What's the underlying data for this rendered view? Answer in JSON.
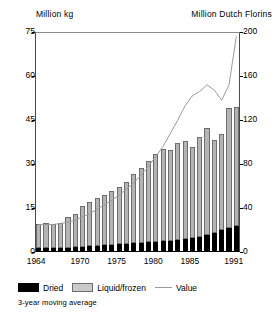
{
  "header": {
    "left_axis_title": "Million kg",
    "right_axis_title": "Million Dutch Florins"
  },
  "legend": {
    "dried_label": "Dried",
    "liquid_label": "Liquid/frozen",
    "value_label": "Value",
    "footnote": "3-year moving average"
  },
  "colors": {
    "dried": "#000000",
    "liquid": "#b4b4b4",
    "value_line": "#9a9a9a",
    "axis": "#000000"
  },
  "chart_data": {
    "type": "bar",
    "title": "",
    "subtitle": "",
    "xlabel": "",
    "ylabel": "Million kg",
    "y2label": "Million Dutch Florins",
    "ylim": [
      0,
      75
    ],
    "y2lim": [
      0,
      200
    ],
    "yticks": [
      0,
      15,
      30,
      45,
      60,
      75
    ],
    "y2ticks": [
      0,
      40,
      80,
      120,
      160,
      200
    ],
    "grid": false,
    "legend_position": "below",
    "categories": [
      "1964",
      "1965",
      "1966",
      "1967",
      "1968",
      "1969",
      "1970",
      "1971",
      "1972",
      "1973",
      "1974",
      "1975",
      "1976",
      "1977",
      "1978",
      "1979",
      "1980",
      "1981",
      "1982",
      "1983",
      "1984",
      "1985",
      "1986",
      "1987",
      "1988",
      "1989",
      "1990",
      "1991"
    ],
    "xtick_labels": [
      "1964",
      "1970",
      "1975",
      "1980",
      "1985",
      "1991"
    ],
    "xtick_categories": [
      "1964",
      "1970",
      "1975",
      "1980",
      "1985",
      "1991"
    ],
    "stacked": true,
    "series": [
      {
        "name": "Dried",
        "axis": "left",
        "values": [
          1.3,
          1.3,
          1.2,
          1.3,
          1.5,
          1.7,
          1.8,
          2.0,
          2.2,
          2.3,
          2.5,
          2.6,
          2.8,
          3.0,
          3.2,
          3.4,
          3.5,
          3.7,
          3.9,
          4.2,
          4.4,
          4.8,
          5.2,
          5.8,
          6.5,
          7.4,
          8.2,
          8.8
        ]
      },
      {
        "name": "Liquid/frozen",
        "axis": "left",
        "values": [
          8.2,
          8.5,
          8.3,
          8.7,
          10.4,
          11.4,
          13.8,
          15.0,
          16.2,
          17.3,
          18.4,
          19.6,
          21.2,
          23.5,
          25.5,
          27.6,
          29.8,
          31.3,
          31.0,
          33.0,
          33.4,
          31.0,
          34.0,
          36.5,
          31.7,
          33.0,
          41.0,
          40.7
        ]
      }
    ],
    "bar_totals": [
      9.5,
      9.8,
      9.5,
      10.0,
      11.9,
      13.1,
      15.6,
      17.0,
      18.4,
      19.6,
      20.9,
      22.2,
      24.0,
      26.5,
      28.7,
      31.0,
      33.3,
      35.0,
      34.9,
      37.2,
      37.8,
      35.8,
      39.2,
      42.3,
      38.2,
      40.4,
      49.2,
      49.5
    ],
    "line_series": {
      "name": "Value",
      "axis": "right",
      "note": "3-year moving average",
      "values": [
        25,
        25,
        25,
        26,
        27,
        29,
        32,
        35,
        39,
        43,
        47,
        52,
        57,
        63,
        70,
        78,
        87,
        96,
        108,
        120,
        133,
        142,
        146,
        152,
        147,
        138,
        152,
        196
      ]
    }
  }
}
